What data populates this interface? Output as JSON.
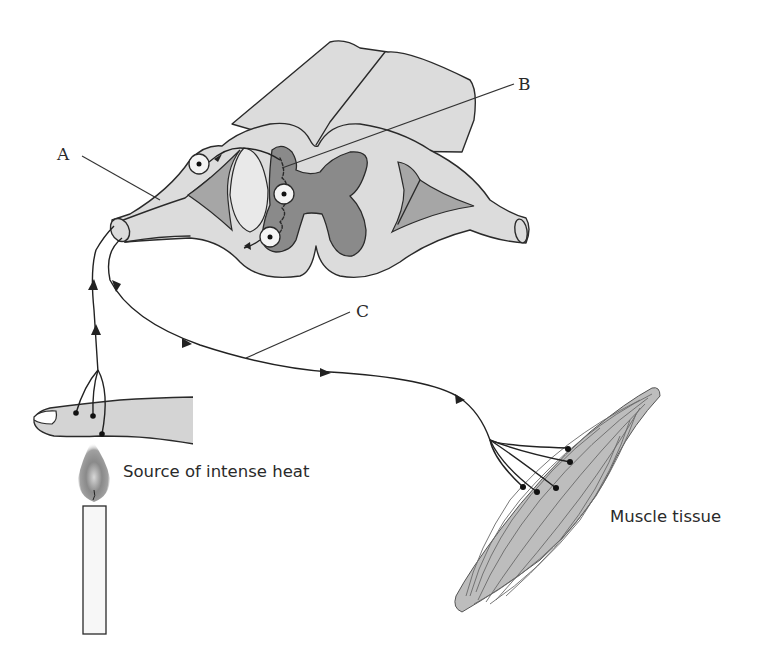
{
  "diagram": {
    "type": "reflex arc",
    "labels": {
      "A": "A",
      "B": "B",
      "C": "C"
    },
    "captions": {
      "heat_source": "Source of intense heat",
      "muscle": "Muscle tissue"
    },
    "components": [
      {
        "id": "spinal-cord",
        "description": "Spinal cord cross-section with grey and white matter"
      },
      {
        "id": "sensory-neuron",
        "label": "A",
        "description": "Sensory neuron entering dorsal root"
      },
      {
        "id": "interneuron",
        "label": "B",
        "description": "Relay neuron within grey matter"
      },
      {
        "id": "motor-neuron",
        "label": "C",
        "description": "Motor neuron running to muscle"
      },
      {
        "id": "finger",
        "description": "Finger with receptor endings"
      },
      {
        "id": "candle",
        "description": "Candle flame as heat stimulus"
      },
      {
        "id": "muscle-tissue",
        "description": "Effector muscle with motor end plates"
      }
    ],
    "colors": {
      "white_matter": "#dcdcdc",
      "grey_matter": "#8a8a8a",
      "horn_shade": "#a6a6a6",
      "skin": "#d4d4d4",
      "muscle": "#bdbdbd",
      "line": "#2a2a2a",
      "background": "#ffffff"
    }
  }
}
